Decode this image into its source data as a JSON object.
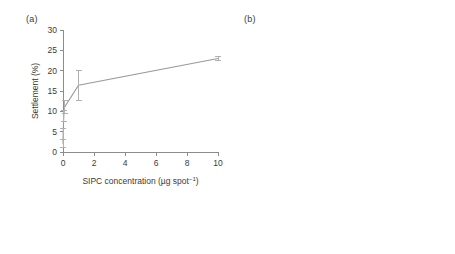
{
  "figure": {
    "panel_a_label": "(a)",
    "panel_b_label": "(b)"
  },
  "chart_data": [
    {
      "type": "line",
      "panel": "(a)",
      "title": "",
      "xlabel": "SIPC concentration (µg spot⁻¹)",
      "ylabel": "Settlement (%)",
      "xlabel_main": "SIPC concentration (µg spot",
      "xlabel_sup": "−1",
      "xlabel_tail": ")",
      "xlim": [
        0,
        10
      ],
      "ylim": [
        0,
        30
      ],
      "xticks": [
        0,
        2,
        4,
        6,
        8,
        10
      ],
      "xtick_labels": [
        "0",
        "2",
        "4",
        "6",
        "8",
        "10"
      ],
      "yticks": [
        0,
        5,
        10,
        15,
        20,
        25,
        30
      ],
      "ytick_labels": [
        "0",
        "5",
        "10",
        "15",
        "20",
        "25",
        "30"
      ],
      "grid": false,
      "legend": "none",
      "marker_color": "#bdbdbd",
      "line_color": "#9a9a9a",
      "x": [
        0.0,
        0.01,
        0.05,
        0.1,
        1.0,
        10.0
      ],
      "y": [
        2.0,
        4.5,
        8.8,
        11.0,
        16.4,
        23.0
      ],
      "yerr": [
        1.0,
        1.4,
        1.3,
        1.6,
        3.7,
        0.6
      ]
    },
    {
      "type": "bar",
      "panel": "(b)",
      "title": "",
      "xlabel": "",
      "ylabel": "Settlement (%)",
      "ylim": [
        0,
        30
      ],
      "yticks": [
        0,
        10,
        20,
        30
      ],
      "ytick_labels": [
        "0",
        "10",
        "20",
        "30"
      ],
      "grid": false,
      "legend": "none",
      "categories": [
        "Balanus amphitrite",
        "Balanus improvisus",
        "Megabalanus rosa",
        "Elminius modestus",
        "hA2M",
        "Control"
      ],
      "category_styles": [
        "italic",
        "italic",
        "italic",
        "italic",
        "normal",
        "normal"
      ],
      "values": [
        24.5,
        9.7,
        9.8,
        3.3,
        0.3,
        1.2
      ],
      "errors": [
        1.6,
        1.7,
        2.6,
        2.0,
        0.2,
        0.6
      ],
      "bar_colors": [
        "#4a4a4a",
        "#d8d8d8",
        "#d8d8d8",
        "#9a9a9a",
        "#d8d8d8",
        "#bdbdbd"
      ],
      "significance_letters": [
        "a",
        "b",
        "b",
        "c",
        "d",
        "d"
      ]
    }
  ]
}
